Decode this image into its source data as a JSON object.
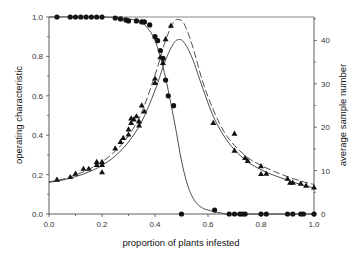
{
  "chart_data": {
    "type": "line",
    "title": "",
    "xlabel": "proportion of plants infested",
    "ylabel_left": "operating characteristic",
    "ylabel_right": "average sample number",
    "xlim": [
      0,
      1.0
    ],
    "ylim_left": [
      0,
      1.0
    ],
    "ylim_right": [
      0,
      45.4
    ],
    "grid": false,
    "legend": null,
    "x_ticks": [
      "0.0",
      "0.2",
      "0.4",
      "0.6",
      "0.8",
      "1.0"
    ],
    "y_ticks_left": [
      "0.0",
      "0.2",
      "0.4",
      "0.6",
      "0.8",
      "1.0"
    ],
    "y_ticks_right": [
      "0",
      "10",
      "20",
      "30",
      "40"
    ],
    "series": [
      {
        "name": "OC observed",
        "axis": "left",
        "style": "markers",
        "marker": "circle",
        "points": [
          [
            0.03,
            1.0
          ],
          [
            0.08,
            1.0
          ],
          [
            0.1,
            1.0
          ],
          [
            0.12,
            1.0
          ],
          [
            0.14,
            1.0
          ],
          [
            0.16,
            1.0
          ],
          [
            0.18,
            1.0
          ],
          [
            0.2,
            1.0
          ],
          [
            0.25,
            0.995
          ],
          [
            0.27,
            0.99
          ],
          [
            0.29,
            0.985
          ],
          [
            0.3,
            0.98
          ],
          [
            0.33,
            0.98
          ],
          [
            0.35,
            0.975
          ],
          [
            0.36,
            0.975
          ],
          [
            0.38,
            0.96
          ],
          [
            0.4,
            0.9
          ],
          [
            0.41,
            0.88
          ],
          [
            0.42,
            0.83
          ],
          [
            0.43,
            0.79
          ],
          [
            0.44,
            0.68
          ],
          [
            0.45,
            0.6
          ],
          [
            0.47,
            0.55
          ],
          [
            0.5,
            0.0
          ],
          [
            0.625,
            0.02
          ],
          [
            0.68,
            0.0
          ],
          [
            0.7,
            0.0
          ],
          [
            0.72,
            0.0
          ],
          [
            0.73,
            0.0
          ],
          [
            0.74,
            0.0
          ],
          [
            0.8,
            0.0
          ],
          [
            0.82,
            0.0
          ],
          [
            0.9,
            0.0
          ],
          [
            0.92,
            0.0
          ],
          [
            0.95,
            0.0
          ],
          [
            0.96,
            0.0
          ],
          [
            1.0,
            0.0
          ]
        ]
      },
      {
        "name": "OC model",
        "axis": "left",
        "style": "solid",
        "points": [
          [
            0.0,
            1.0
          ],
          [
            0.2,
            1.0
          ],
          [
            0.3,
            0.99
          ],
          [
            0.35,
            0.97
          ],
          [
            0.38,
            0.93
          ],
          [
            0.4,
            0.88
          ],
          [
            0.42,
            0.8
          ],
          [
            0.44,
            0.69
          ],
          [
            0.46,
            0.56
          ],
          [
            0.48,
            0.42
          ],
          [
            0.5,
            0.27
          ],
          [
            0.52,
            0.16
          ],
          [
            0.54,
            0.09
          ],
          [
            0.56,
            0.05
          ],
          [
            0.58,
            0.03
          ],
          [
            0.6,
            0.02
          ],
          [
            0.65,
            0.005
          ],
          [
            0.7,
            0.0
          ],
          [
            1.0,
            0.0
          ]
        ]
      },
      {
        "name": "ASN observed",
        "axis": "right",
        "style": "markers",
        "marker": "triangle",
        "points": [
          [
            0.03,
            7.9
          ],
          [
            0.08,
            8.5
          ],
          [
            0.1,
            9.3
          ],
          [
            0.13,
            10.4
          ],
          [
            0.15,
            10.4
          ],
          [
            0.18,
            11.3
          ],
          [
            0.18,
            12.0
          ],
          [
            0.2,
            9.6
          ],
          [
            0.2,
            11.3
          ],
          [
            0.2,
            12.0
          ],
          [
            0.25,
            15.1
          ],
          [
            0.27,
            16.6
          ],
          [
            0.28,
            17.5
          ],
          [
            0.3,
            18.3
          ],
          [
            0.3,
            19.5
          ],
          [
            0.31,
            21.0
          ],
          [
            0.31,
            22.0
          ],
          [
            0.32,
            21.8
          ],
          [
            0.33,
            22.5
          ],
          [
            0.34,
            21.3
          ],
          [
            0.34,
            20.4
          ],
          [
            0.35,
            25.0
          ],
          [
            0.36,
            23.6
          ],
          [
            0.4,
            30.2
          ],
          [
            0.4,
            31.2
          ],
          [
            0.44,
            40.3
          ],
          [
            0.46,
            43.4
          ],
          [
            0.42,
            36.1
          ],
          [
            0.43,
            34.8
          ],
          [
            0.62,
            21.0
          ],
          [
            0.7,
            14.6
          ],
          [
            0.7,
            18.5
          ],
          [
            0.74,
            12.9
          ],
          [
            0.75,
            12.2
          ],
          [
            0.8,
            11.0
          ],
          [
            0.8,
            9.2
          ],
          [
            0.82,
            9.3
          ],
          [
            0.9,
            8.1
          ],
          [
            0.91,
            7.2
          ],
          [
            0.92,
            7.2
          ],
          [
            0.95,
            7.0
          ],
          [
            0.97,
            6.5
          ],
          [
            1.0,
            6.1
          ]
        ]
      },
      {
        "name": "ASN model (dashed)",
        "axis": "right",
        "style": "dashed",
        "points": [
          [
            0.0,
            7.4
          ],
          [
            0.05,
            8.0
          ],
          [
            0.1,
            9.0
          ],
          [
            0.15,
            10.3
          ],
          [
            0.2,
            12.0
          ],
          [
            0.25,
            14.5
          ],
          [
            0.3,
            18.0
          ],
          [
            0.35,
            23.5
          ],
          [
            0.4,
            32.0
          ],
          [
            0.44,
            40.0
          ],
          [
            0.47,
            44.2
          ],
          [
            0.49,
            44.8
          ],
          [
            0.51,
            43.8
          ],
          [
            0.54,
            39.0
          ],
          [
            0.58,
            30.5
          ],
          [
            0.62,
            24.0
          ],
          [
            0.66,
            19.0
          ],
          [
            0.7,
            15.8
          ],
          [
            0.75,
            13.0
          ],
          [
            0.8,
            11.2
          ],
          [
            0.85,
            9.8
          ],
          [
            0.9,
            8.6
          ],
          [
            0.95,
            7.6
          ],
          [
            1.0,
            6.8
          ]
        ]
      },
      {
        "name": "ASN model (solid)",
        "axis": "right",
        "style": "solid",
        "points": [
          [
            0.0,
            7.3
          ],
          [
            0.05,
            7.8
          ],
          [
            0.1,
            8.6
          ],
          [
            0.15,
            9.7
          ],
          [
            0.2,
            11.2
          ],
          [
            0.25,
            13.4
          ],
          [
            0.3,
            16.6
          ],
          [
            0.35,
            21.3
          ],
          [
            0.4,
            28.5
          ],
          [
            0.44,
            35.5
          ],
          [
            0.47,
            39.3
          ],
          [
            0.49,
            40.2
          ],
          [
            0.51,
            39.5
          ],
          [
            0.54,
            36.0
          ],
          [
            0.58,
            29.0
          ],
          [
            0.62,
            22.5
          ],
          [
            0.66,
            18.0
          ],
          [
            0.7,
            14.8
          ],
          [
            0.75,
            12.0
          ],
          [
            0.8,
            10.2
          ],
          [
            0.85,
            8.9
          ],
          [
            0.9,
            7.8
          ],
          [
            0.95,
            6.8
          ],
          [
            1.0,
            6.0
          ]
        ]
      }
    ]
  }
}
